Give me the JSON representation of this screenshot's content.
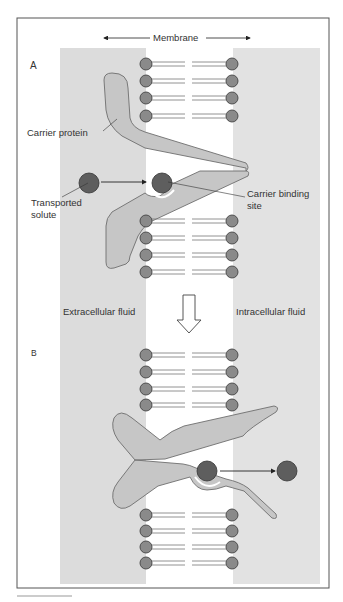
{
  "figure": {
    "membrane_label": "Membrane",
    "panel_a_label": "A",
    "panel_b_label": "B",
    "labels": {
      "carrier_protein": "Carrier protein",
      "transported_solute_line1": "Transported",
      "transported_solute_line2": "solute",
      "binding_site_line1": "Carrier binding",
      "binding_site_line2": "site",
      "extracellular": "Extracellular fluid",
      "intracellular": "Intracellular fluid"
    },
    "colors": {
      "fluid_band": "#dcdcdc",
      "protein_fill": "#c6c6c6",
      "protein_stroke": "#6e6e6e",
      "lipid_head": "#8a8a8a",
      "solute": "#5e5e5e",
      "frame": "#555555"
    }
  }
}
